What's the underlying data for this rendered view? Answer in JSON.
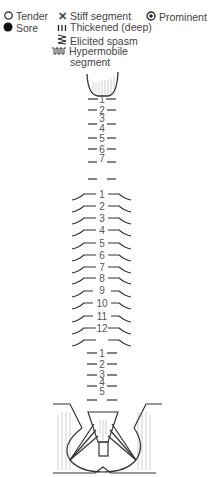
{
  "legend": {
    "tender": "Tender",
    "sore": "Sore",
    "stiff": "Stiff segment",
    "thickened": "Thickened (deep)",
    "spasm": "Elicited spasm",
    "hypermobile_1": "Hypermobile",
    "hypermobile_2": "segment",
    "prominent": "Prominent"
  },
  "spine": {
    "cervical": [
      "1",
      "2",
      "3",
      "4",
      "5",
      "6",
      "7"
    ],
    "thoracic": [
      "1",
      "2",
      "3",
      "4",
      "5",
      "6",
      "7",
      "8",
      "9",
      "10",
      "11",
      "12"
    ],
    "lumbar": [
      "1",
      "2",
      "3",
      "4",
      "5"
    ]
  },
  "colors": {
    "line": "#333333",
    "text": "#555555",
    "hatch": "#bbbbbb"
  }
}
